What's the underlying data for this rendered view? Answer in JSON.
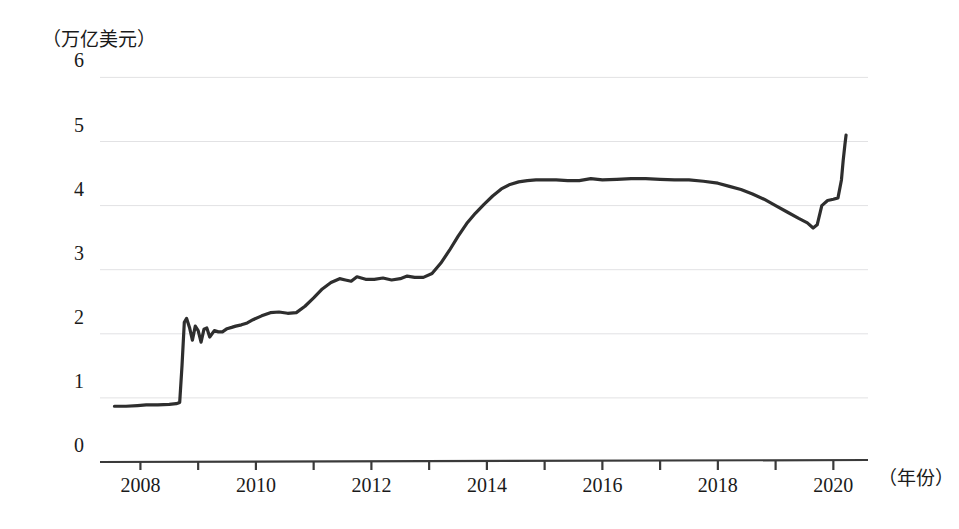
{
  "chart_data": {
    "type": "line",
    "title": "",
    "subtitle": "",
    "xlabel": "（年份）",
    "ylabel": "（万亿美元）",
    "ylim": [
      0,
      6
    ],
    "xlim": [
      2007.3,
      2020.6
    ],
    "grid": true,
    "legend_position": "none",
    "y_ticks": [
      "0",
      "1",
      "2",
      "3",
      "4",
      "5",
      "6"
    ],
    "y_tick_values": [
      0,
      1,
      2,
      3,
      4,
      5,
      6
    ],
    "x_ticks_labeled": [
      "2008",
      "2010",
      "2012",
      "2014",
      "2016",
      "2018",
      "2020"
    ],
    "x_tick_values_all": [
      2008,
      2009,
      2010,
      2011,
      2012,
      2013,
      2014,
      2015,
      2016,
      2017,
      2018,
      2019,
      2020
    ],
    "series": [
      {
        "name": "美联储资产规模",
        "color": "#2e2e2e",
        "x": [
          2007.55,
          2007.75,
          2007.95,
          2008.1,
          2008.3,
          2008.5,
          2008.62,
          2008.68,
          2008.72,
          2008.76,
          2008.8,
          2008.85,
          2008.9,
          2008.95,
          2009.0,
          2009.05,
          2009.1,
          2009.15,
          2009.2,
          2009.28,
          2009.35,
          2009.42,
          2009.5,
          2009.58,
          2009.65,
          2009.75,
          2009.85,
          2009.95,
          2010.1,
          2010.25,
          2010.4,
          2010.55,
          2010.7,
          2010.85,
          2011.0,
          2011.15,
          2011.3,
          2011.45,
          2011.55,
          2011.65,
          2011.75,
          2011.9,
          2012.05,
          2012.2,
          2012.35,
          2012.5,
          2012.62,
          2012.75,
          2012.9,
          2013.05,
          2013.2,
          2013.35,
          2013.5,
          2013.65,
          2013.8,
          2013.95,
          2014.1,
          2014.25,
          2014.4,
          2014.55,
          2014.7,
          2014.85,
          2015.0,
          2015.2,
          2015.4,
          2015.6,
          2015.8,
          2016.0,
          2016.25,
          2016.5,
          2016.75,
          2017.0,
          2017.25,
          2017.5,
          2017.75,
          2018.0,
          2018.2,
          2018.4,
          2018.6,
          2018.8,
          2019.0,
          2019.2,
          2019.4,
          2019.55,
          2019.65,
          2019.72,
          2019.8,
          2019.9,
          2020.0,
          2020.08,
          2020.14,
          2020.17,
          2020.2,
          2020.22
        ],
        "y": [
          0.87,
          0.87,
          0.88,
          0.89,
          0.89,
          0.9,
          0.91,
          0.93,
          1.5,
          2.18,
          2.24,
          2.1,
          1.9,
          2.12,
          2.05,
          1.87,
          2.07,
          2.09,
          1.95,
          2.05,
          2.03,
          2.03,
          2.08,
          2.1,
          2.12,
          2.14,
          2.17,
          2.22,
          2.28,
          2.33,
          2.34,
          2.32,
          2.33,
          2.43,
          2.56,
          2.7,
          2.8,
          2.86,
          2.84,
          2.82,
          2.89,
          2.85,
          2.85,
          2.87,
          2.84,
          2.86,
          2.9,
          2.88,
          2.88,
          2.94,
          3.1,
          3.3,
          3.52,
          3.72,
          3.88,
          4.02,
          4.15,
          4.26,
          4.33,
          4.37,
          4.39,
          4.4,
          4.4,
          4.4,
          4.39,
          4.39,
          4.42,
          4.4,
          4.41,
          4.42,
          4.42,
          4.41,
          4.4,
          4.4,
          4.38,
          4.35,
          4.3,
          4.25,
          4.18,
          4.1,
          4.0,
          3.9,
          3.8,
          3.73,
          3.65,
          3.7,
          4.0,
          4.08,
          4.1,
          4.12,
          4.4,
          4.7,
          4.95,
          5.1
        ]
      }
    ],
    "annotations": []
  }
}
